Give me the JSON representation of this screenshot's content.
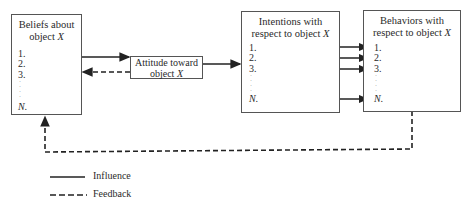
{
  "diagram": {
    "boxes": {
      "beliefs": {
        "title_line1": "Beliefs about",
        "title_line2": "object",
        "title_var": "X",
        "items": [
          "1.",
          "2.",
          "3.",
          "N."
        ]
      },
      "attitude": {
        "title_line1": "Attitude toward",
        "title_line2": "object",
        "title_var": "X"
      },
      "intentions": {
        "title_line1": "Intentions with",
        "title_line2": "respect to object",
        "title_var": "X",
        "items": [
          "1.",
          "2.",
          "3.",
          "N."
        ]
      },
      "behaviors": {
        "title_line1": "Behaviors with",
        "title_line2": "respect to object",
        "title_var": "X",
        "items": [
          "1.",
          "2.",
          "3.",
          "N."
        ]
      }
    },
    "edges": [
      {
        "from": "beliefs",
        "to": "attitude",
        "type": "influence"
      },
      {
        "from": "attitude",
        "to": "beliefs",
        "type": "feedback"
      },
      {
        "from": "attitude",
        "to": "intentions",
        "type": "influence"
      },
      {
        "from": "intentions.1",
        "to": "behaviors.1",
        "type": "influence"
      },
      {
        "from": "intentions.2",
        "to": "behaviors.2",
        "type": "influence"
      },
      {
        "from": "intentions.3",
        "to": "behaviors.3",
        "type": "influence"
      },
      {
        "from": "intentions.N",
        "to": "behaviors.N",
        "type": "influence"
      },
      {
        "from": "behaviors",
        "to": "beliefs",
        "type": "feedback"
      }
    ],
    "legend": {
      "influence": "Influence",
      "feedback": "Feedback"
    },
    "colors": {
      "line": "#222222",
      "border": "#555555"
    }
  }
}
